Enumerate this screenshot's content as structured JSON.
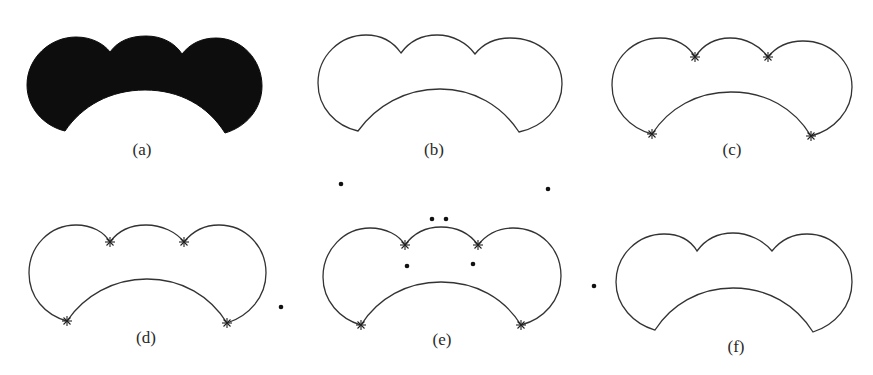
{
  "figure": {
    "panels": [
      {
        "id": "a",
        "label": "(a)",
        "style": "filled",
        "description": "solid black three-lobed crescent shape"
      },
      {
        "id": "b",
        "label": "(b)",
        "style": "outline",
        "description": "boundary contour of the shape"
      },
      {
        "id": "c",
        "label": "(c)",
        "style": "outline-with-corners",
        "description": "contour with 4 corner points marked by stars"
      },
      {
        "id": "d",
        "label": "(d)",
        "style": "outline-with-corners",
        "description": "contour with 4 corner points and one isolated point to the right"
      },
      {
        "id": "e",
        "label": "(e)",
        "style": "outline-with-corners-and-points",
        "description": "contour with 4 corner points and several scattered points around it"
      },
      {
        "id": "f",
        "label": "(f)",
        "style": "outline",
        "description": "contour with one isolated point to the left"
      }
    ],
    "colors": {
      "background": "#ffffff",
      "stroke": "#333333",
      "fill": "#0d0d0d"
    }
  }
}
